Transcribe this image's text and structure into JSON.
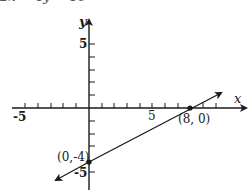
{
  "header": {
    "equation_cut": "2x − 4y = 16"
  },
  "axes": {
    "x_label": "x",
    "y_label": "y",
    "x_tick_neg5": "-5",
    "x_tick_5": "5",
    "y_tick_5": "5",
    "y_tick_neg5": "-5"
  },
  "points": {
    "x_intercept": "(8, 0)",
    "y_intercept": "(0,-4)"
  },
  "colors": {
    "ink": "#1a1a1a",
    "background": "#ffffff"
  }
}
